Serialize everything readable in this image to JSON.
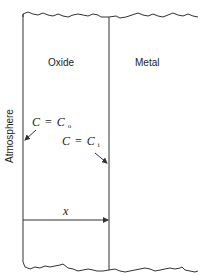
{
  "diagram": {
    "type": "oxide-growth-schematic",
    "regions": {
      "oxide": "Oxide",
      "metal": "Metal",
      "atmosphere": "Atmosphere"
    },
    "annotations": {
      "outer_concentration": {
        "lhs": "C",
        "eq": "=",
        "rhs": "C",
        "subscript": "o"
      },
      "inner_concentration": {
        "lhs": "C",
        "eq": "=",
        "rhs": "C",
        "subscript": "i"
      },
      "thickness": "x"
    },
    "colors": {
      "line": "#333333",
      "text": "#222222",
      "background": "#ffffff"
    }
  }
}
